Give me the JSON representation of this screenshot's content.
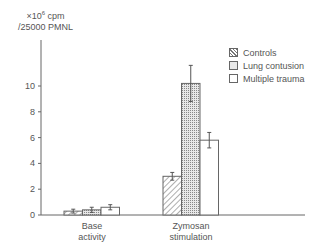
{
  "chart_data": {
    "type": "bar",
    "title": "",
    "ylabel": "×10^6 cpm /25000 PMNL",
    "ylabel_line1": "×10",
    "ylabel_exp": "6",
    "ylabel_unit": " cpm",
    "ylabel_line2": "/25000 PMNL",
    "xlabel": "",
    "ylim": [
      0,
      12
    ],
    "yticks": [
      0,
      2,
      4,
      6,
      8,
      10
    ],
    "categories": [
      "Base activity",
      "Zymosan stimulation"
    ],
    "category_lines": [
      [
        "Base",
        "activity"
      ],
      [
        "Zymosan",
        "stimulation"
      ]
    ],
    "series": [
      {
        "name": "Controls",
        "pattern": "diagonal-hatch",
        "values": [
          0.3,
          3.0
        ],
        "errors": [
          0.15,
          0.3
        ]
      },
      {
        "name": "Lung contusion",
        "pattern": "dotted",
        "values": [
          0.4,
          10.2
        ],
        "errors": [
          0.2,
          1.4
        ]
      },
      {
        "name": "Multiple trauma",
        "pattern": "empty",
        "values": [
          0.6,
          5.8
        ],
        "errors": [
          0.2,
          0.6
        ]
      }
    ],
    "legend_position": "upper right",
    "grid": false
  },
  "colors": {
    "axis": "#666666",
    "text": "#555555"
  }
}
